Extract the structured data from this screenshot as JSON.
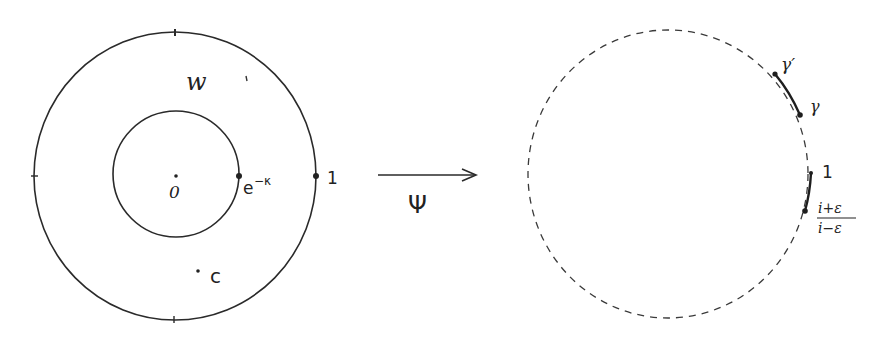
{
  "diagram": {
    "type": "conformal-map-illustration",
    "stroke_color": "#2a2a2a",
    "left_panel": {
      "name": "annulus",
      "outer_circle": {
        "cx": 175,
        "cy": 176,
        "rx": 141,
        "ry": 144,
        "style": "solid"
      },
      "inner_circle": {
        "cx": 176,
        "cy": 174,
        "r": 63,
        "style": "solid"
      },
      "region_label": "w",
      "points": [
        {
          "id": "origin",
          "label": "0",
          "x": 176,
          "y": 180
        },
        {
          "id": "inner-radius",
          "label": "e",
          "superscript": "−κ",
          "x": 239,
          "y": 176
        },
        {
          "id": "one",
          "label": "1",
          "x": 316,
          "y": 176
        },
        {
          "id": "c",
          "label": "c",
          "x": 198,
          "y": 271
        }
      ]
    },
    "map": {
      "label": "Ψ",
      "arrow_from_x": 378,
      "arrow_to_x": 476,
      "arrow_y": 175
    },
    "right_panel": {
      "name": "unit-disk",
      "circle": {
        "cx": 668,
        "cy": 174,
        "rx": 140,
        "ry": 144,
        "style": "dashed"
      },
      "arcs": [
        {
          "id": "gamma-arc",
          "from": "γ′",
          "to": "γ"
        },
        {
          "id": "epsilon-arc",
          "from": "1",
          "to": "(i+ε)/(i−ε)"
        }
      ],
      "points": [
        {
          "id": "gamma-prime",
          "label": "γ′",
          "x": 775,
          "y": 74
        },
        {
          "id": "gamma",
          "label": "γ",
          "x": 800,
          "y": 115
        },
        {
          "id": "one",
          "label": "1",
          "x": 811,
          "y": 173
        },
        {
          "id": "fraction",
          "numerator": "i+ε",
          "denominator": "i−ε",
          "x": 805,
          "y": 211
        }
      ]
    }
  }
}
